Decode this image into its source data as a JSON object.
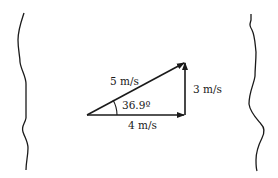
{
  "diagram": {
    "type": "vector-triangle",
    "colors": {
      "ink": "#1a1a1a",
      "background": "#ffffff"
    },
    "vectors": {
      "resultant": {
        "label": "5 m/s",
        "magnitude": 5,
        "unit": "m/s"
      },
      "horizontal": {
        "label": "4 m/s",
        "magnitude": 4,
        "unit": "m/s"
      },
      "vertical": {
        "label": "3 m/s",
        "magnitude": 3,
        "unit": "m/s"
      }
    },
    "angle": {
      "label": "36.9º",
      "degrees": 36.9
    },
    "banks": {
      "left": "left-riverbank",
      "right": "right-riverbank"
    }
  }
}
